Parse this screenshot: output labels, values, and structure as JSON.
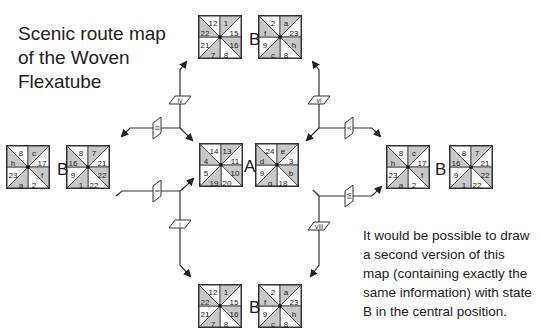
{
  "title": [
    "Scenic route map",
    "of the Woven",
    "Flexatube"
  ],
  "note": [
    "It would be possible to draw",
    "a second version of this",
    "map (containing exactly the",
    "same information) with state",
    "B in the central position."
  ],
  "tiles": {
    "top_B": {
      "x": 198,
      "y": 15,
      "labels": [
        "12",
        "1",
        "15",
        "16",
        "8",
        "7",
        "21",
        "22"
      ]
    },
    "top_right": {
      "x": 258,
      "y": 15,
      "labels": [
        "2",
        "a",
        "23",
        "h",
        "8",
        "c",
        "9",
        "f"
      ]
    },
    "left_far": {
      "x": 6,
      "y": 145,
      "labels": [
        "8",
        "c",
        "17",
        "f",
        "2",
        "a",
        "23",
        "h"
      ]
    },
    "left_B": {
      "x": 66,
      "y": 145,
      "labels": [
        "8",
        "7",
        "21",
        "22",
        "22",
        "1",
        "9",
        "16"
      ]
    },
    "center_A": {
      "x": 199,
      "y": 143,
      "labels": [
        "14",
        "13",
        "11",
        "10",
        "20",
        "19",
        "5",
        "4"
      ]
    },
    "center_right": {
      "x": 255,
      "y": 143,
      "labels": [
        "24",
        "e",
        "3",
        "b",
        "18",
        "g",
        "9",
        "d"
      ]
    },
    "right_near": {
      "x": 386,
      "y": 145,
      "labels": [
        "8",
        "c",
        "17",
        "f",
        "2",
        "a",
        "23",
        "h"
      ]
    },
    "right_B": {
      "x": 449,
      "y": 145,
      "labels": [
        "8",
        "7",
        "21",
        "22",
        "22",
        "1",
        "9",
        "16"
      ]
    },
    "bottom_B": {
      "x": 198,
      "y": 284,
      "labels": [
        "12",
        "1",
        "15",
        "16",
        "8",
        "7",
        "21",
        "22"
      ]
    },
    "bottom_right": {
      "x": 258,
      "y": 284,
      "labels": [
        "2",
        "a",
        "23",
        "h",
        "8",
        "c",
        "9",
        "f"
      ]
    }
  },
  "state_labels": [
    {
      "text": "B",
      "x": 249,
      "y": 30
    },
    {
      "text": "B",
      "x": 57,
      "y": 160
    },
    {
      "text": "A",
      "x": 244,
      "y": 157
    },
    {
      "text": "B",
      "x": 435,
      "y": 160
    },
    {
      "text": "B",
      "x": 249,
      "y": 298
    }
  ],
  "connectors": [
    {
      "label": "i",
      "x": 180,
      "y": 224,
      "orient": "h"
    },
    {
      "label": "ii",
      "x": 157,
      "y": 191,
      "orient": "v"
    },
    {
      "label": "iii",
      "x": 157,
      "y": 128,
      "orient": "v"
    },
    {
      "label": "iv",
      "x": 180,
      "y": 100,
      "orient": "h"
    },
    {
      "label": "v",
      "x": 349,
      "y": 128,
      "orient": "v"
    },
    {
      "label": "vi",
      "x": 319,
      "y": 100,
      "orient": "h"
    },
    {
      "label": "vii",
      "x": 349,
      "y": 196,
      "orient": "v"
    },
    {
      "label": "viii",
      "x": 319,
      "y": 226,
      "orient": "h"
    }
  ],
  "colors": {
    "shade": "#c8c8c8",
    "line": "#333333",
    "text": "#222222"
  }
}
